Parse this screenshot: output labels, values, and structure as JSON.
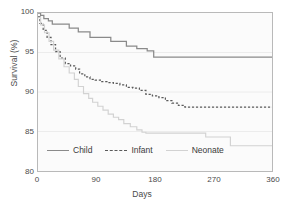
{
  "chart_data": {
    "type": "line",
    "title": "",
    "subtitle": "",
    "xlabel": "Days",
    "ylabel": "Survival (%)",
    "xlim": [
      0,
      360
    ],
    "ylim": [
      80,
      100
    ],
    "xticks": [
      0,
      90,
      180,
      270,
      360
    ],
    "yticks": [
      80,
      85,
      90,
      95,
      100
    ],
    "grid": true,
    "legend_position": "inside-bottom-left",
    "step_style": "post",
    "series": [
      {
        "name": "Child",
        "style": "solid",
        "color": "#8a8a8a",
        "x": [
          0,
          4,
          9,
          16,
          22,
          30,
          48,
          62,
          74,
          80,
          96,
          112,
          124,
          136,
          152,
          168,
          178,
          186,
          360
        ],
        "y": [
          100.0,
          99.7,
          99.3,
          99.0,
          98.6,
          98.6,
          98.1,
          97.6,
          97.6,
          96.9,
          96.9,
          96.4,
          96.4,
          95.8,
          95.5,
          95.2,
          94.4,
          94.4,
          94.4
        ]
      },
      {
        "name": "Infant",
        "style": "dashed",
        "color": "#5a5a5a",
        "x": [
          0,
          3,
          8,
          14,
          20,
          27,
          34,
          42,
          50,
          58,
          64,
          72,
          80,
          88,
          96,
          106,
          116,
          126,
          136,
          146,
          156,
          166,
          176,
          186,
          196,
          206,
          216,
          226,
          236,
          360
        ],
        "y": [
          99.5,
          98.7,
          97.8,
          96.9,
          96.0,
          95.1,
          94.3,
          93.6,
          93.3,
          92.9,
          92.3,
          91.9,
          91.6,
          91.5,
          91.3,
          91.2,
          91.1,
          90.9,
          90.6,
          90.5,
          90.2,
          89.7,
          89.5,
          89.3,
          88.9,
          88.6,
          88.3,
          88.1,
          88.1,
          88.1
        ]
      },
      {
        "name": "Neonate",
        "style": "solid-light",
        "color": "#d2d2d2",
        "x": [
          0,
          4,
          10,
          17,
          24,
          32,
          40,
          48,
          56,
          62,
          70,
          78,
          84,
          92,
          100,
          108,
          116,
          124,
          132,
          142,
          152,
          160,
          166,
          210,
          258,
          266,
          288,
          296,
          360
        ],
        "y": [
          99.4,
          98.5,
          97.5,
          96.4,
          95.3,
          94.2,
          93.2,
          92.4,
          91.6,
          90.7,
          89.8,
          89.2,
          88.7,
          88.2,
          87.7,
          87.2,
          86.8,
          86.5,
          86.0,
          85.6,
          85.2,
          84.9,
          84.8,
          84.8,
          84.3,
          84.3,
          84.3,
          83.2,
          83.2
        ]
      }
    ]
  },
  "axes": {
    "ylabel": "Survival (%)",
    "xlabel": "Days",
    "ytick_labels": [
      "100",
      "95",
      "90",
      "85",
      "80"
    ],
    "xtick_labels": [
      "0",
      "90",
      "180",
      "270",
      "360"
    ]
  },
  "legend": {
    "items": [
      {
        "label": "Child"
      },
      {
        "label": "Infant"
      },
      {
        "label": "Neonate"
      }
    ]
  }
}
